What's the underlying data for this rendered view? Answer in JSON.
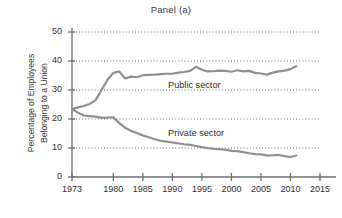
{
  "chart_data": {
    "type": "line",
    "title": "Panel (a)",
    "xlabel": "",
    "ylabel": "Percentage of Employees Belonging to a Union",
    "ylabel_lines": [
      "Percentage of Employees",
      "Belonging to a Union"
    ],
    "xlim": [
      1973,
      2015
    ],
    "ylim": [
      0,
      50
    ],
    "yticks": [
      0,
      10,
      20,
      30,
      40,
      50
    ],
    "xticks": [
      1973,
      1980,
      1985,
      1990,
      1995,
      2000,
      2005,
      2010,
      2015
    ],
    "grid": "horizontal-dotted",
    "legend_position": "inline-annotations",
    "line_color": "#8f8f8f",
    "axis_color": "#6e6e6e",
    "series": [
      {
        "name": "Public sector",
        "label": "Public sector",
        "label_x": 1994,
        "label_y": 31.5,
        "x": [
          1973,
          1974,
          1975,
          1976,
          1977,
          1978,
          1979,
          1980,
          1981,
          1982,
          1983,
          1984,
          1985,
          1986,
          1987,
          1988,
          1989,
          1990,
          1991,
          1992,
          1993,
          1994,
          1995,
          1996,
          1997,
          1998,
          1999,
          2000,
          2001,
          2002,
          2003,
          2004,
          2005,
          2006,
          2007,
          2008,
          2009,
          2010,
          2011
        ],
        "values": [
          23.4,
          24.0,
          24.5,
          25.2,
          26.5,
          30.0,
          33.5,
          35.9,
          36.4,
          34.0,
          34.6,
          34.4,
          35.1,
          35.2,
          35.3,
          35.5,
          35.6,
          35.6,
          36.0,
          36.2,
          36.6,
          38.0,
          37.0,
          36.4,
          36.5,
          36.7,
          36.6,
          36.3,
          36.8,
          36.4,
          36.6,
          35.9,
          35.7,
          35.3,
          36.0,
          36.4,
          36.7,
          37.2,
          38.2
        ]
      },
      {
        "name": "Private sector",
        "label": "Private sector",
        "label_x": 1994,
        "label_y": 15.0,
        "x": [
          1973,
          1974,
          1975,
          1976,
          1977,
          1978,
          1979,
          1980,
          1981,
          1982,
          1983,
          1984,
          1985,
          1986,
          1987,
          1988,
          1989,
          1990,
          1991,
          1992,
          1993,
          1994,
          1995,
          1996,
          1997,
          1998,
          1999,
          2000,
          2001,
          2002,
          2003,
          2004,
          2005,
          2006,
          2007,
          2008,
          2009,
          2010,
          2011
        ],
        "values": [
          23.4,
          22.2,
          21.2,
          21.0,
          20.8,
          20.4,
          20.5,
          20.6,
          18.6,
          17.0,
          15.9,
          15.2,
          14.3,
          13.7,
          13.0,
          12.5,
          12.2,
          11.9,
          11.6,
          11.3,
          11.1,
          10.7,
          10.3,
          10.0,
          9.7,
          9.6,
          9.4,
          9.0,
          8.9,
          8.6,
          8.2,
          7.9,
          7.8,
          7.4,
          7.5,
          7.6,
          7.2,
          6.9,
          7.4
        ]
      }
    ]
  }
}
